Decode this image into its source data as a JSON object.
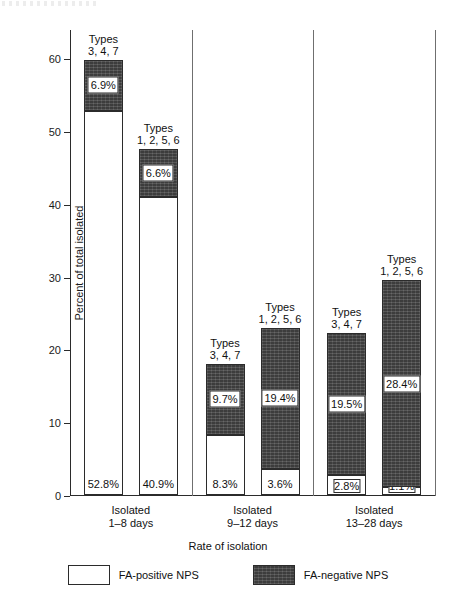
{
  "chart_data": {
    "type": "bar",
    "subtype": "stacked-grouped",
    "title": "",
    "xlabel": "Rate of isolation",
    "ylabel": "Percent of total isolated",
    "ylim": [
      0,
      64
    ],
    "yticks": [
      0,
      10,
      20,
      30,
      40,
      50,
      60
    ],
    "ytick_labels": [
      "0",
      "10",
      "20",
      "30",
      "40",
      "50",
      "60"
    ],
    "grid": false,
    "legend_position": "bottom",
    "legend": [
      {
        "name": "FA-positive NPS",
        "color": "#ffffff",
        "key": "pos"
      },
      {
        "name": "FA-negative NPS",
        "color": "#4a4a4a",
        "key": "neg"
      }
    ],
    "categories": [
      "Isolated 1–8 days",
      "Isolated 9–12 days",
      "Isolated 13–28 days"
    ],
    "groups": [
      {
        "label_line1": "Isolated",
        "label_line2": "1–8 days",
        "bars": [
          {
            "caption_line1": "Types",
            "caption_line2": "3, 4, 7",
            "pos_value": 52.8,
            "neg_value": 6.9,
            "pos_label": "52.8%",
            "neg_label": "6.9%",
            "total": 59.7
          },
          {
            "caption_line1": "Types",
            "caption_line2": "1, 2, 5, 6",
            "pos_value": 40.9,
            "neg_value": 6.6,
            "pos_label": "40.9%",
            "neg_label": "6.6%",
            "total": 47.5
          }
        ]
      },
      {
        "label_line1": "Isolated",
        "label_line2": "9–12 days",
        "bars": [
          {
            "caption_line1": "Types",
            "caption_line2": "3, 4, 7",
            "pos_value": 8.3,
            "neg_value": 9.7,
            "pos_label": "8.3%",
            "neg_label": "9.7%",
            "total": 18.0
          },
          {
            "caption_line1": "Types",
            "caption_line2": "1, 2, 5, 6",
            "pos_value": 3.6,
            "neg_value": 19.4,
            "pos_label": "3.6%",
            "neg_label": "19.4%",
            "total": 23.0
          }
        ]
      },
      {
        "label_line1": "Isolated",
        "label_line2": "13–28 days",
        "bars": [
          {
            "caption_line1": "Types",
            "caption_line2": "3, 4, 7",
            "pos_value": 2.8,
            "neg_value": 19.5,
            "pos_label": "2.8%",
            "neg_label": "19.5%",
            "total": 22.3
          },
          {
            "caption_line1": "Types",
            "caption_line2": "1, 2, 5, 6",
            "pos_value": 1.1,
            "neg_value": 28.4,
            "pos_label": "1.1%",
            "neg_label": "28.4%",
            "total": 29.5
          }
        ]
      }
    ]
  },
  "axis": {
    "ylabel": "Percent of total isolated",
    "xlabel": "Rate of isolation"
  },
  "legend": {
    "positive": "FA-positive NPS",
    "negative": "FA-negative NPS"
  },
  "colors": {
    "fa_negative": "#4a4a4a",
    "fa_positive": "#ffffff",
    "axis": "#2b2b2b"
  }
}
